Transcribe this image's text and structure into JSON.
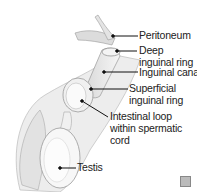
{
  "diagram": {
    "type": "anatomical illustration",
    "labels": [
      {
        "id": "peritoneum",
        "text": "Peritoneum"
      },
      {
        "id": "deep-ring-1",
        "text": "Deep"
      },
      {
        "id": "deep-ring-2",
        "text": "inguinal ring"
      },
      {
        "id": "inguinal-canal",
        "text": "Inguinal canal"
      },
      {
        "id": "superficial-ring-1",
        "text": "Superficial"
      },
      {
        "id": "superficial-ring-2",
        "text": "inguinal ring"
      },
      {
        "id": "intestinal-loop-1",
        "text": "Intestinal loop"
      },
      {
        "id": "intestinal-loop-2",
        "text": "within spermatic"
      },
      {
        "id": "intestinal-loop-3",
        "text": "cord"
      },
      {
        "id": "testis",
        "text": "Testis"
      }
    ],
    "colors": {
      "line": "#111111",
      "tissue": "#e6e6e6",
      "outline": "#9a9a9a"
    }
  }
}
